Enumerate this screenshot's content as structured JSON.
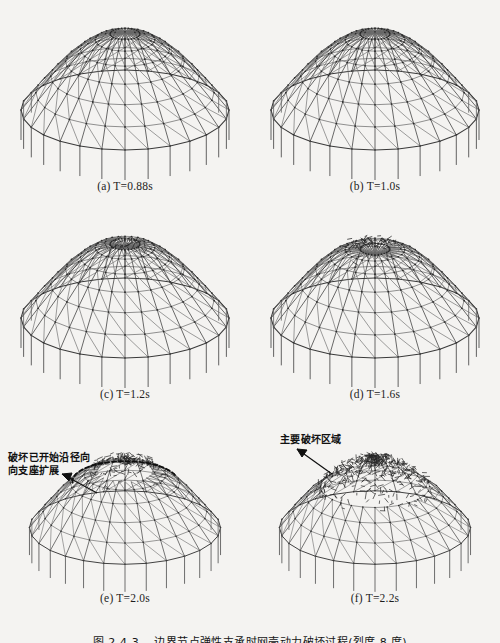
{
  "figure": {
    "caption": "图 2-4-3　 边界节点弹性支承时网壳动力破坏过程(烈度 8 度)",
    "background_color": "#f4f3f1",
    "line_color": "#3a3a3a"
  },
  "panels": [
    {
      "id": "a",
      "label": "(a)",
      "symbol": "T",
      "eq": "=",
      "value": "0.88s",
      "caption": "(a) T=0.88s",
      "state": "intact"
    },
    {
      "id": "b",
      "label": "(b)",
      "symbol": "T",
      "eq": "=",
      "value": "1.0s",
      "caption": "(b) T=1.0s",
      "state": "intact"
    },
    {
      "id": "c",
      "label": "(c)",
      "symbol": "T",
      "eq": "=",
      "value": "1.2s",
      "caption": "(c) T=1.2s",
      "state": "local-dent"
    },
    {
      "id": "d",
      "label": "(d)",
      "symbol": "T",
      "eq": "=",
      "value": "1.6s",
      "caption": "(d) T=1.6s",
      "state": "local-dent-large"
    },
    {
      "id": "e",
      "label": "(e)",
      "symbol": "T",
      "eq": "=",
      "value": "2.0s",
      "caption": "(e) T=2.0s",
      "state": "radial-spread"
    },
    {
      "id": "f",
      "label": "(f)",
      "symbol": "T",
      "eq": "=",
      "value": "2.2s",
      "caption": "(f) T=2.2s",
      "state": "collapse"
    }
  ],
  "annotations": {
    "e": "破坏已开始沿径向\n向支座扩展",
    "f": "主要破坏区域"
  },
  "chart_data": {
    "type": "diagram",
    "title": "边界节点弹性支承时网壳动力破坏过程(烈度 8 度)",
    "view": "3D perspective wireframe, viewed slightly from above",
    "structure": {
      "mesh_type": "Kiewitt ribbed-and-triangulated single layer reticulated shell",
      "radial_ribs": 28,
      "hoop_rings": 7,
      "diagonal_bracing": true,
      "support_columns": 28,
      "column_condition": "elastic spring supports at boundary nodes"
    },
    "time_steps_s": [
      0.88,
      1.0,
      1.2,
      1.6,
      2.0,
      2.2
    ],
    "series": [
      {
        "name": "T=0.88s",
        "damage_state": "intact",
        "damage_fraction": 0.0
      },
      {
        "name": "T=1.0s",
        "damage_state": "intact",
        "damage_fraction": 0.02
      },
      {
        "name": "T=1.2s",
        "damage_state": "local buckling at crown",
        "damage_fraction": 0.08
      },
      {
        "name": "T=1.6s",
        "damage_state": "enlarged crown dent",
        "damage_fraction": 0.18
      },
      {
        "name": "T=2.0s",
        "damage_state": "radial propagation toward supports",
        "damage_fraction": 0.45
      },
      {
        "name": "T=2.2s",
        "damage_state": "global collapse of crown region",
        "damage_fraction": 0.85
      }
    ],
    "xlabel": "Time T (s)",
    "ylabel": "Damage extent",
    "grid": false,
    "legend": "none"
  }
}
